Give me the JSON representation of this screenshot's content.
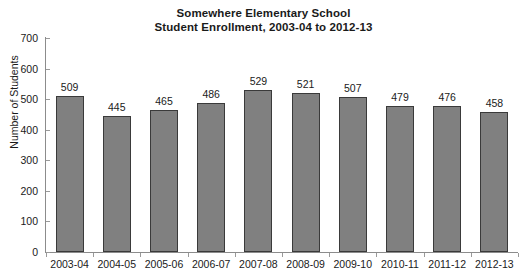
{
  "chart_data": {
    "type": "bar",
    "title": "Somewhere Elementary School Student Enrollment, 2003-04 to 2012-13",
    "title_lines": [
      "Somewhere Elementary School",
      "Student Enrollment, 2003-04 to 2012-13"
    ],
    "xlabel": "",
    "ylabel": "Number of Students",
    "categories": [
      "2003-04",
      "2004-05",
      "2005-06",
      "2006-07",
      "2007-08",
      "2008-09",
      "2009-10",
      "2010-11",
      "2011-12",
      "2012-13"
    ],
    "values": [
      509,
      445,
      465,
      486,
      529,
      521,
      507,
      479,
      476,
      458
    ],
    "ylim": [
      0,
      700
    ],
    "ytick_step": 100,
    "yticks": [
      0,
      100,
      200,
      300,
      400,
      500,
      600,
      700
    ],
    "ytick_labels": [
      "0",
      "100",
      "200",
      "300",
      "400",
      "500",
      "600",
      "700"
    ],
    "grid": false,
    "legend": false,
    "legend_position": "none",
    "data_labels": true,
    "colors": {
      "bar_fill": "#808080",
      "bar_outline": "#3a3a3a",
      "axis": "#8c8c8c",
      "text": "#1a1a1a",
      "background": "#ffffff"
    }
  }
}
